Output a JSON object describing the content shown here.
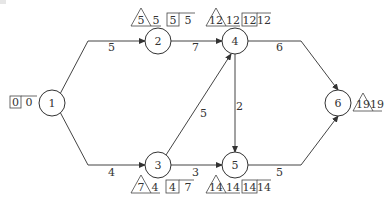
{
  "diagram": {
    "type": "activity-on-arrow network (critical path)",
    "nodes": [
      {
        "id": "1",
        "label": "1",
        "triangle": null,
        "triangle_after": null,
        "box": [
          "0",
          "0"
        ],
        "box_side": "left"
      },
      {
        "id": "2",
        "label": "2",
        "triangle": "5",
        "triangle_after": "5",
        "box": [
          "5",
          "5"
        ]
      },
      {
        "id": "3",
        "label": "3",
        "triangle": "7",
        "triangle_after": "4",
        "box": [
          "4",
          "7"
        ]
      },
      {
        "id": "4",
        "label": "4",
        "triangle": "12",
        "triangle_after": "12",
        "box": [
          "12",
          "12"
        ]
      },
      {
        "id": "5",
        "label": "5",
        "triangle": "14",
        "triangle_after": "14",
        "box": [
          "14",
          "14"
        ]
      },
      {
        "id": "6",
        "label": "6",
        "triangle": "19",
        "triangle_after": "19",
        "box": null
      }
    ],
    "edges": [
      {
        "from": "1",
        "to": "2",
        "duration": "5"
      },
      {
        "from": "1",
        "to": "3",
        "duration": "4"
      },
      {
        "from": "2",
        "to": "4",
        "duration": "7"
      },
      {
        "from": "3",
        "to": "4",
        "duration": "5"
      },
      {
        "from": "3",
        "to": "5",
        "duration": "3"
      },
      {
        "from": "4",
        "to": "5",
        "duration": "2"
      },
      {
        "from": "4",
        "to": "6",
        "duration": "6"
      },
      {
        "from": "5",
        "to": "6",
        "duration": "5"
      }
    ]
  }
}
